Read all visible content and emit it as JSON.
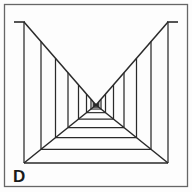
{
  "figure": {
    "panel_label": "D",
    "background_color": "#fdfdfd",
    "ink_color": "#2a2a2a",
    "frame_color": "#555555",
    "frame": {
      "x": 4,
      "y": 4,
      "width": 184,
      "height": 183
    },
    "label_position": {
      "x": 13,
      "y": 182
    }
  },
  "chart_data": {
    "type": "diagram",
    "vanishing_point": {
      "x": 96,
      "y": 105
    },
    "corridor": {
      "left_top": {
        "x": 24,
        "y": 22
      },
      "right_top": {
        "x": 168,
        "y": 22
      },
      "left_bottom": {
        "x": 24,
        "y": 163
      },
      "right_bottom": {
        "x": 168,
        "y": 163
      },
      "top_stub_length": 10,
      "near_post_count": 14
    },
    "left_posts_x": [
      24,
      41,
      55.5,
      68,
      78.5,
      86.5,
      91,
      93.3,
      94.6,
      95.3,
      95.7,
      95.9,
      96,
      96
    ],
    "right_posts_x": [
      168,
      151,
      136.5,
      124,
      113.5,
      105.5,
      101,
      98.7,
      97.4,
      96.7,
      96.3,
      96.1,
      96,
      96
    ],
    "floor_beam_count": 14,
    "ylim": [
      0,
      192
    ],
    "xlim": [
      0,
      192
    ],
    "grid": false,
    "legend": false
  }
}
